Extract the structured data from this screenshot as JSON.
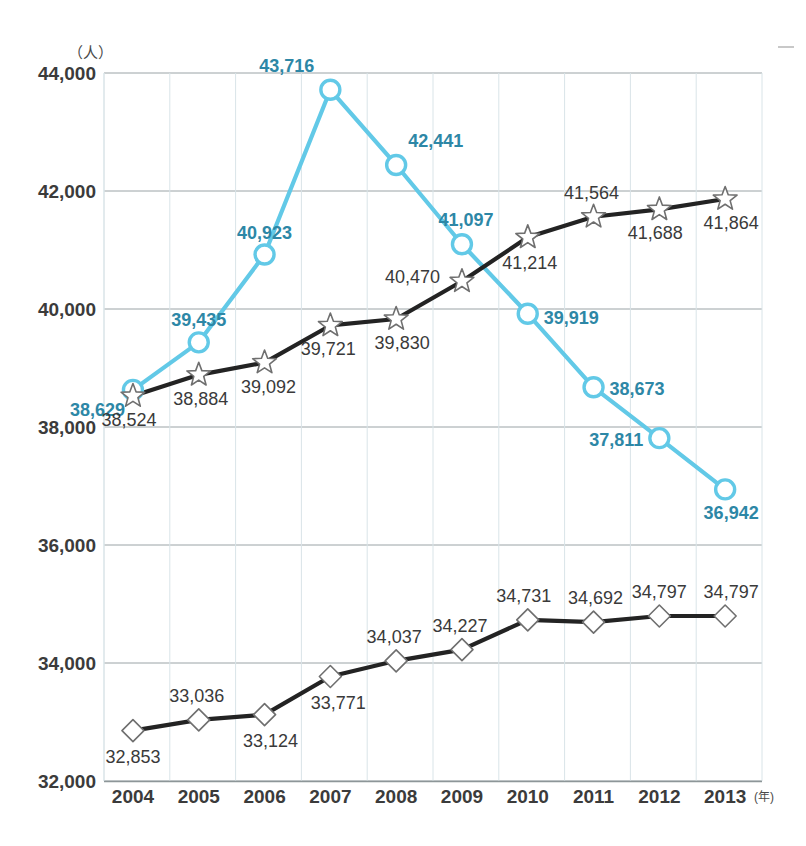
{
  "chart_data": {
    "type": "line",
    "title": "",
    "xlabel": "年",
    "ylabel": "人",
    "x": [
      "2004",
      "2005",
      "2006",
      "2007",
      "2008",
      "2009",
      "2010",
      "2011",
      "2012",
      "2013"
    ],
    "categories": [
      "2004",
      "2005",
      "2006",
      "2007",
      "2008",
      "2009",
      "2010",
      "2011",
      "2012",
      "2013"
    ],
    "ylim": [
      32000,
      44000
    ],
    "yticks": [
      32000,
      34000,
      36000,
      38000,
      40000,
      42000,
      44000
    ],
    "ytick_labels": [
      "32,000",
      "34,000",
      "36,000",
      "38,000",
      "40,000",
      "42,000",
      "44,000"
    ],
    "grid": true,
    "legend": "none",
    "series": [
      {
        "name": "cyan-circle-series",
        "marker": "circle",
        "color": "#62c9e7",
        "label_color": "#2d87a6",
        "values": [
          38629,
          39435,
          40923,
          43716,
          42441,
          41097,
          39919,
          38673,
          37811,
          36942
        ],
        "value_labels": [
          "38,629",
          "39,435",
          "40,923",
          "43,716",
          "42,441",
          "41,097",
          "39,919",
          "38,673",
          "37,811",
          "36,942"
        ]
      },
      {
        "name": "black-star-series",
        "marker": "star",
        "color": "#232323",
        "label_color": "#3a3a3a",
        "values": [
          38524,
          38884,
          39092,
          39721,
          39830,
          40470,
          41214,
          41564,
          41688,
          41864
        ],
        "value_labels": [
          "38,524",
          "38,884",
          "39,092",
          "39,721",
          "39,830",
          "40,470",
          "41,214",
          "41,564",
          "41,688",
          "41,864"
        ]
      },
      {
        "name": "black-diamond-series",
        "marker": "diamond",
        "color": "#232323",
        "label_color": "#3a3a3a",
        "values": [
          32853,
          33036,
          33124,
          33771,
          34037,
          34227,
          34731,
          34692,
          34797,
          34797
        ],
        "value_labels": [
          "32,853",
          "33,036",
          "33,124",
          "33,771",
          "34,037",
          "34,227",
          "34,731",
          "34,692",
          "34,797",
          "34,797"
        ]
      }
    ]
  },
  "axis": {
    "y_unit": "（人）",
    "x_unit": "(年)"
  }
}
